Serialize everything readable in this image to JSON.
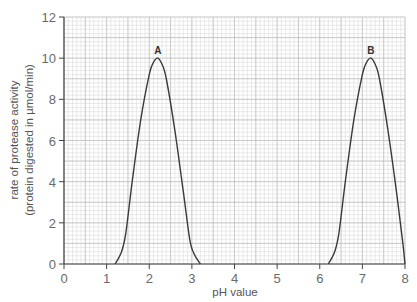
{
  "chart_data": {
    "type": "line",
    "title": "",
    "xlabel": "pH value",
    "ylabel": [
      "rate of protease activity",
      "(protein digested in µmol/min)"
    ],
    "xlim": [
      0,
      8
    ],
    "ylim": [
      0,
      12
    ],
    "xticks": [
      0,
      1,
      2,
      3,
      4,
      5,
      6,
      7,
      8
    ],
    "yticks": [
      0,
      2,
      4,
      6,
      8,
      10,
      12
    ],
    "grid": true,
    "grid_minor_x": 0.1,
    "grid_minor_y": 0.2,
    "legend": "none",
    "series": [
      {
        "name": "A",
        "x": [
          1.2,
          1.35,
          1.45,
          1.6,
          1.8,
          2.0,
          2.1,
          2.2,
          2.3,
          2.4,
          2.6,
          2.8,
          2.95,
          3.05,
          3.2
        ],
        "y": [
          0,
          0.6,
          1.5,
          4.0,
          7.0,
          9.2,
          9.8,
          10,
          9.7,
          9.0,
          6.5,
          3.5,
          1.2,
          0.5,
          0
        ]
      },
      {
        "name": "B",
        "x": [
          6.2,
          6.35,
          6.45,
          6.6,
          6.8,
          7.0,
          7.1,
          7.2,
          7.3,
          7.4,
          7.6,
          7.8,
          7.95,
          8.0
        ],
        "y": [
          0,
          0.6,
          1.5,
          4.0,
          7.0,
          9.2,
          9.8,
          10,
          9.7,
          9.0,
          6.5,
          3.5,
          1.0,
          0
        ]
      }
    ],
    "annotations": [
      {
        "text": "A",
        "x": 2.2,
        "y": 10
      },
      {
        "text": "B",
        "x": 7.2,
        "y": 10
      }
    ]
  },
  "colors": {
    "curve": "#3a3a3a",
    "grid_minor": "#dcdcdc",
    "grid_major": "#bdbdbd",
    "axis": "#444444"
  }
}
